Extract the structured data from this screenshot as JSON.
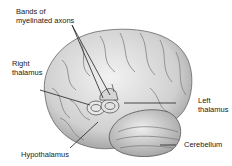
{
  "diagram": {
    "labels": {
      "bands": "Bands of\nmyelinated axons",
      "right_thalamus": "Right\nthalamus",
      "left_thalamus": "Left\nthalamus",
      "cerebellum": "Cerebellum",
      "hypothalamus": "Hypothalamus"
    },
    "colors": {
      "brain_fill": "#dcdcdc",
      "brain_shade": "#a8a8a8",
      "outline": "#555555",
      "leader": "#222222"
    }
  }
}
